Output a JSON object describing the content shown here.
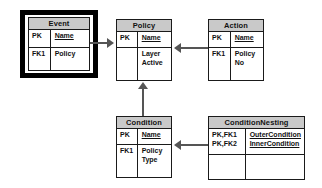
{
  "diagram": {
    "colors": {
      "header_fill": "#c9c9c9",
      "border": "#1a1a1a",
      "connector": "#555555",
      "highlight": "#000000",
      "background": "#ffffff"
    },
    "entities": [
      {
        "id": "event",
        "name": "Event",
        "highlighted": true,
        "key_attributes": [
          {
            "key": "PK",
            "attribute": "Name",
            "primary": true
          }
        ],
        "other_attributes": [
          {
            "key": "FK1",
            "attribute": "Policy",
            "primary": false
          }
        ]
      },
      {
        "id": "policy",
        "name": "Policy",
        "highlighted": false,
        "key_attributes": [
          {
            "key": "PK",
            "attribute": "Name",
            "primary": true
          }
        ],
        "other_attributes": [
          {
            "key": "",
            "attribute": "Layer",
            "primary": false
          },
          {
            "key": "",
            "attribute": "Active",
            "primary": false
          }
        ]
      },
      {
        "id": "action",
        "name": "Action",
        "highlighted": false,
        "key_attributes": [
          {
            "key": "PK",
            "attribute": "Name",
            "primary": true
          }
        ],
        "other_attributes": [
          {
            "key": "FK1",
            "attribute": "Policy",
            "primary": false
          },
          {
            "key": "",
            "attribute": "No",
            "primary": false
          }
        ]
      },
      {
        "id": "condition",
        "name": "Condition",
        "highlighted": false,
        "key_attributes": [
          {
            "key": "PK",
            "attribute": "Name",
            "primary": true
          }
        ],
        "other_attributes": [
          {
            "key": "FK1",
            "attribute": "Policy",
            "primary": false
          },
          {
            "key": "",
            "attribute": "Type",
            "primary": false
          }
        ]
      },
      {
        "id": "conditionnesting",
        "name": "ConditionNesting",
        "highlighted": false,
        "key_attributes": [
          {
            "key": "PK,FK1",
            "attribute": "OuterCondition",
            "primary": true
          },
          {
            "key": "PK,FK2",
            "attribute": "InnerCondition",
            "primary": true
          }
        ],
        "other_attributes": []
      }
    ],
    "relationships": [
      {
        "id": "event-to-policy",
        "from": "Event",
        "to": "Policy",
        "direction": "right"
      },
      {
        "id": "action-to-policy",
        "from": "Action",
        "to": "Policy",
        "direction": "left"
      },
      {
        "id": "condition-to-policy",
        "from": "Condition",
        "to": "Policy",
        "direction": "up"
      },
      {
        "id": "conditionnesting-to-condition",
        "from": "ConditionNesting",
        "to": "Condition",
        "direction": "left"
      }
    ]
  },
  "labels": {
    "event_title": "Event",
    "event_pk_key": "PK",
    "event_pk_attr": "Name",
    "event_fk_key": "FK1",
    "event_fk_attr": "Policy",
    "policy_title": "Policy",
    "policy_pk_key": "PK",
    "policy_pk_attr": "Name",
    "policy_body_key": "",
    "policy_attr_1": "Layer",
    "policy_attr_2": "Active",
    "action_title": "Action",
    "action_pk_key": "PK",
    "action_pk_attr": "Name",
    "action_fk_key": "FK1",
    "action_attr_1": "Policy",
    "action_attr_2": "No",
    "condition_title": "Condition",
    "condition_pk_key": "PK",
    "condition_pk_attr": "Name",
    "condition_fk_key": "FK1",
    "condition_attr_1": "Policy",
    "condition_attr_2": "Type",
    "cn_title": "ConditionNesting",
    "cn_key_1": "PK,FK1",
    "cn_attr_1": "OuterCondition",
    "cn_key_2": "PK,FK2",
    "cn_attr_2": "InnerCondition",
    "cn_body_key": "",
    "cn_body_attr": ""
  }
}
